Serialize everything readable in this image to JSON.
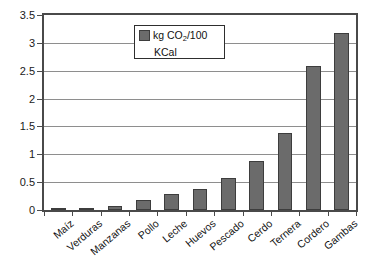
{
  "chart_data": {
    "type": "bar",
    "title": "",
    "xlabel": "",
    "ylabel": "",
    "ylim": [
      0,
      3.5
    ],
    "ytick_labels": [
      "0",
      "0.5",
      "1",
      "1.5",
      "2",
      "2.5",
      "3",
      "3.5"
    ],
    "ytick_values": [
      0,
      0.5,
      1,
      1.5,
      2,
      2.5,
      3,
      3.5
    ],
    "grid": true,
    "legend_position": "upper-center",
    "categories": [
      "Maíz",
      "Verduras",
      "Manzanas",
      "Pollo",
      "Leche",
      "Huevos",
      "Pescado",
      "Cerdo",
      "Ternera",
      "Cordero",
      "Gambas"
    ],
    "values": [
      0.03,
      0.03,
      0.08,
      0.18,
      0.29,
      0.38,
      0.58,
      0.88,
      1.38,
      2.58,
      3.17
    ],
    "series": [
      {
        "name": "kg CO2/100 KCal",
        "values": [
          0.03,
          0.03,
          0.08,
          0.18,
          0.29,
          0.38,
          0.58,
          0.88,
          1.38,
          2.58,
          3.17
        ]
      }
    ]
  },
  "legend": {
    "label_prefix": "kg CO",
    "label_subscript": "2",
    "label_suffix": "/100",
    "label_line2": "KCal"
  },
  "colors": {
    "bar_fill": "#6b6b6b",
    "bar_border": "#3d3d3d",
    "gridline": "#8e8e8e",
    "axis": "#4a4a4a",
    "text": "#111111",
    "background": "#ffffff"
  }
}
